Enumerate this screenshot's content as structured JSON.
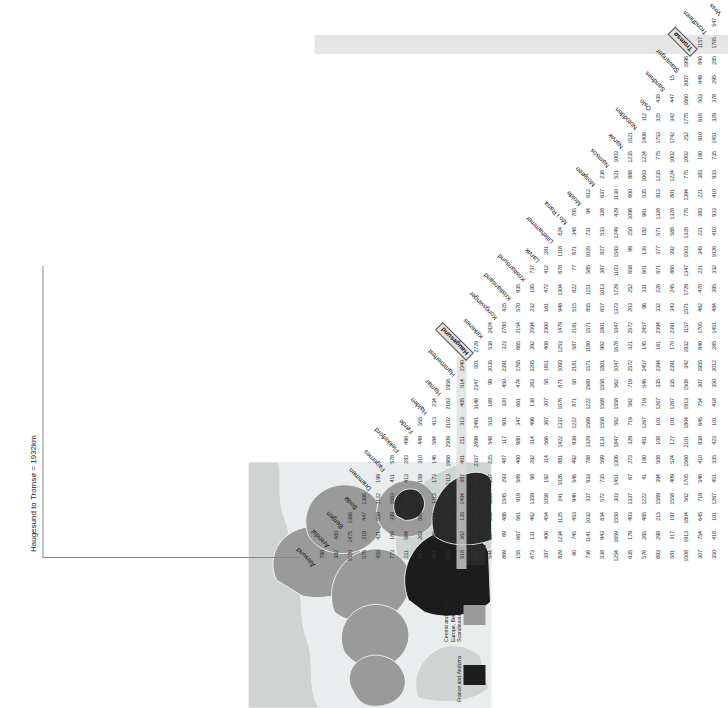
{
  "figure": {
    "annotation": "Haugesund to Tromsø = 1932km"
  },
  "map": {
    "legend": [
      {
        "label": "France and Andorra",
        "color": "#1c1c1c"
      },
      {
        "label": "Central and South East Europe, Benelux and Scandinavia",
        "color": "#9a9a9a"
      },
      {
        "label": "Spain and Portugal",
        "color": "#2a2a2a"
      }
    ],
    "sea_color": "#e9edee",
    "land_color": "#cfd4d2"
  },
  "highlight": {
    "row": "Haugesund",
    "column": "Tromsø"
  },
  "chart_data": {
    "type": "table",
    "title": "Haugesund to Tromsø = 1932km",
    "xlabel": "",
    "ylabel": "",
    "categories": [
      "Ålesund",
      "Arendal",
      "Bergen",
      "Bodø",
      "Drammen",
      "Fagernes",
      "Flekkefjord",
      "Førde",
      "Halden",
      "Hamar",
      "Hammerfest",
      "Haugesund",
      "Kirkenes",
      "Kongsvinger",
      "Kristiansand",
      "Kristiansund",
      "Larvik",
      "Lillehammer",
      "Mo i Rana",
      "Molde",
      "Mosjøen",
      "Namsos",
      "Narvik",
      "Notodden",
      "Oslo",
      "Sandnes",
      "Stavanger",
      "Tromsø",
      "Trondheim",
      "Voss"
    ],
    "rows": [
      {
        "label": "Arendal",
        "values": [
          788
        ]
      },
      {
        "label": "Bergen",
        "values": [
          382,
          480
        ]
      },
      {
        "label": "Bodø",
        "values": [
          1070,
          1475,
          1366
        ]
      },
      {
        "label": "Drammen",
        "values": [
          576,
          219,
          447,
          1366
        ]
      },
      {
        "label": "Fagernes",
        "values": [
          455,
          421,
          558,
          1122,
          199
        ]
      },
      {
        "label": "Flekkefjord",
        "values": [
          773,
          189,
          399,
          1663,
          411,
          578
        ]
      },
      {
        "label": "Førde",
        "values": [
          211,
          584,
          177,
          1256,
          413,
          283,
          498
        ]
      },
      {
        "label": "Halden",
        "values": [
          691,
          262,
          589,
          1317,
          159,
          310,
          449,
          555
        ]
      },
      {
        "label": "Hamar",
        "values": [
          441,
          395,
          481,
          1112,
          173,
          146,
          584,
          413,
          234
        ]
      },
      {
        "label": "Hammerfest",
        "values": [
          1916,
          2321,
          2212,
          199,
          2113,
          1968,
          2509,
          2102,
          2163,
          1958
        ]
      },
      {
        "label": "Haugesund",
        "values": [
          518,
          362,
          135,
          1494,
          387,
          401,
          211,
          313,
          405,
          514,
          2340
        ]
      },
      {
        "label": "Kirkenes",
        "values": [
          2305,
          2710,
          2601,
          548,
          2502,
          2357,
          2899,
          2491,
          3146,
          2347,
          501,
          2729
        ]
      },
      {
        "label": "Kongsvinger",
        "values": [
          544,
          357,
          598,
          1189,
          137,
          225,
          548,
          518,
          169,
          99,
          2035,
          538,
          2424
        ]
      },
      {
        "label": "Kristiansand",
        "values": [
          869,
          69,
          486,
          1545,
          293,
          487,
          117,
          601,
          320,
          450,
          2391,
          323,
          2780,
          425
        ]
      },
      {
        "label": "Kristiansund",
        "values": [
          155,
          667,
          561,
          919,
          589,
          460,
          980,
          347,
          661,
          474,
          1765,
          665,
          2154,
          570,
          935
        ]
      },
      {
        "label": "Larvik",
        "values": [
          673,
          131,
          462,
          1359,
          98,
          292,
          314,
          496,
          138,
          263,
          2205,
          392,
          2594,
          232,
          195,
          737
        ]
      },
      {
        "label": "Lillehammer",
        "values": [
          387,
          406,
          454,
          1056,
          192,
          114,
          566,
          367,
          307,
          58,
          1911,
          408,
          2300,
          161,
          472,
          412,
          281
        ]
      },
      {
        "label": "Mo i Rana",
        "values": [
          829,
          1234,
          1125,
          241,
          1026,
          881,
          1422,
          1337,
          1076,
          871,
          1093,
          1253,
          1479,
          948,
          1304,
          678,
          1118,
          824
        ]
      },
      {
        "label": "Molde",
        "values": [
          80,
          745,
          453,
          946,
          546,
          492,
          939,
          1222,
          871,
          58,
          2181,
          587,
          2181,
          515,
          822,
          77,
          671,
          348,
          705
        ]
      },
      {
        "label": "Mosjøen",
        "values": [
          736,
          1141,
          1032,
          337,
          933,
          788,
          1329,
          1569,
          1222,
          1569,
          1571,
          1160,
          1571,
          855,
          1211,
          585,
          1025,
          731,
          94,
          612
        ]
      },
      {
        "label": "Namsos",
        "values": [
          538,
          943,
          834,
          572,
          735,
          599,
          1131,
          1558,
          1569,
          1558,
          1801,
          962,
          1801,
          657,
          1013,
          387,
          827,
          533,
          328,
          637,
          236
        ]
      },
      {
        "label": "Narvik",
        "values": [
          1254,
          1659,
          1550,
          303,
          1451,
          1306,
          1847,
          562,
          1558,
          562,
          1047,
          1678,
          1047,
          1373,
          1729,
          1103,
          1543,
          1249,
          429,
          1130,
          521,
          1003
        ]
      },
      {
        "label": "Notodden",
        "values": [
          635,
          179,
          403,
          1337,
          67,
          273,
          329,
          719,
          562,
          719,
          2572,
          321,
          2572,
          203,
          252,
          658,
          99,
          250,
          1096,
          600,
          888,
          1235,
          1521
        ]
      },
      {
        "label": "Oslo",
        "values": [
          576,
          265,
          485,
          1222,
          41,
          190,
          451,
          1267,
          719,
          546,
          2457,
          145,
          2457,
          96,
          331,
          601,
          135,
          182,
          961,
          535,
          1003,
          1224,
          1406,
          112
        ]
      },
      {
        "label": "Sandnes",
        "values": [
          693,
          298,
          215,
          1569,
          394,
          508,
          108,
          101,
          1267,
          335,
          2394,
          161,
          2394,
          332,
          226,
          871,
          377,
          571,
          1328,
          813,
          1235,
          775,
          1753,
          325,
          435
        ]
      },
      {
        "label": "Stavanger",
        "values": [
          581,
          317,
          197,
          1558,
          409,
          524,
          127,
          101,
          1267,
          335,
          2391,
          170,
          2391,
          343,
          245,
          860,
          392,
          588,
          1328,
          801,
          1224,
          1002,
          1742,
          342,
          447,
          15
        ]
      },
      {
        "label": "Tromsø",
        "values": [
          1508,
          1913,
          1804,
          562,
          1705,
          1560,
          2101,
          1804,
          1913,
          1508,
          342,
          1932,
          1157,
          1571,
          1729,
          1347,
          1503,
          1328,
          775,
          1394,
          775,
          1002,
          252,
          1775,
          1660,
          2007,
          1996
        ]
      },
      {
        "label": "Trondheim",
        "values": [
          307,
          754,
          645,
          719,
          546,
          410,
          938,
          645,
          754,
          307,
          1955,
          840,
          1705,
          462,
          478,
          221,
          345,
          221,
          383,
          221,
          383,
          190,
          910,
          616,
          503,
          849,
          840,
          1157
        ]
      },
      {
        "label": "Voss",
        "values": [
          350,
          418,
          101,
          1267,
          451,
          335,
          423,
          101,
          418,
          350,
          2012,
          285,
          1451,
          484,
          395,
          332,
          1026,
          410,
          933,
          410,
          933,
          735,
          1451,
          329,
          378,
          295,
          285,
          1705,
          547
        ]
      }
    ]
  },
  "columns": [
    "Ålesund",
    "Arendal",
    "Bergen",
    "Bodø",
    "Drammen",
    "Fagernes",
    "Flekkefjord",
    "Førde",
    "Halden",
    "Hamar",
    "Hammerfest",
    "Haugesund",
    "Kirkenes",
    "Kongsvinger",
    "Kristiansand",
    "Kristiansund",
    "Larvik",
    "Lillehammer",
    "Mo i Rana",
    "Molde",
    "Mosjøen",
    "Namsos",
    "Narvik",
    "Notodden",
    "Oslo",
    "Sandnes",
    "Stavanger",
    "Tromsø",
    "Trondheim",
    "Voss"
  ]
}
